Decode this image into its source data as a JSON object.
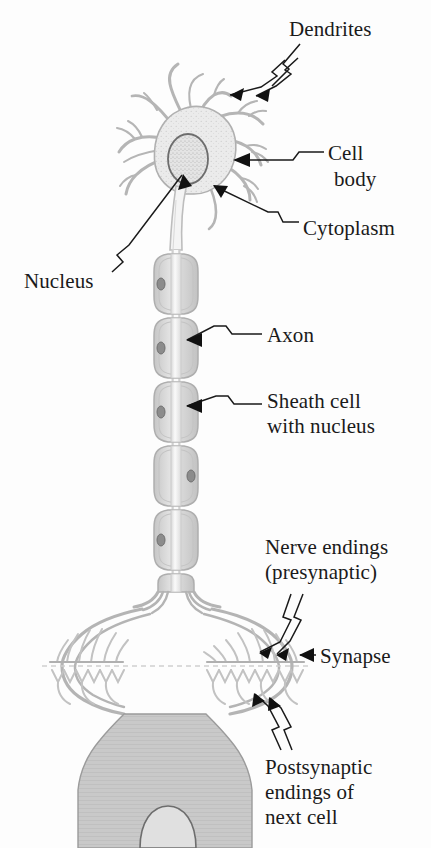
{
  "diagram": {
    "background_color": "#fdfdfd",
    "ink_color": "#1a1a1a",
    "cell_outline_color": "#b9b9b9",
    "cell_fill_color": "#ebebeb",
    "next_cell_fill_color": "#c9c9c9",
    "sheath_fill_color": "#dcdcdc",
    "axon_fill_color": "#f2f2f2"
  },
  "labels": {
    "dendrites": "Dendrites",
    "cell_body_line1": "Cell",
    "cell_body_line2": "body",
    "cytoplasm": "Cytoplasm",
    "nucleus": "Nucleus",
    "axon": "Axon",
    "sheath_line1": "Sheath cell",
    "sheath_line2": "with nucleus",
    "nerve_endings_line1": "Nerve endings",
    "nerve_endings_line2": "(presynaptic)",
    "synapse": "Synapse",
    "postsynaptic_line1": "Postsynaptic",
    "postsynaptic_line2": "endings of",
    "postsynaptic_line3": "next cell"
  },
  "parts": {
    "soma": "cell-body",
    "nucleus": "nucleus",
    "cytoplasm": "cytoplasm",
    "dendrites": "dendrites",
    "axon": "axon",
    "sheath_cells": "sheath-cells-with-nucleus",
    "terminals": "nerve-endings-presynaptic",
    "synapse_cleft": "synapse",
    "postsynaptic": "postsynaptic-endings-next-cell"
  },
  "counts": {
    "sheath_cell_segments": 6,
    "dendrite_branches": 9,
    "terminal_clusters": 2
  }
}
